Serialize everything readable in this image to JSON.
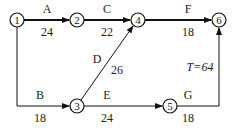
{
  "diagram": {
    "type": "activity-on-arrow network",
    "total_time_label": "T=64",
    "nodes": [
      {
        "id": "1",
        "label": "1",
        "x": 17,
        "y": 20
      },
      {
        "id": "2",
        "label": "2",
        "x": 77,
        "y": 20
      },
      {
        "id": "4",
        "label": "4",
        "x": 138,
        "y": 20
      },
      {
        "id": "6",
        "label": "6",
        "x": 219,
        "y": 20
      },
      {
        "id": "3",
        "label": "3",
        "x": 77,
        "y": 106
      },
      {
        "id": "5",
        "label": "5",
        "x": 170,
        "y": 106
      }
    ],
    "edges": [
      {
        "name": "A",
        "duration": "24",
        "from": "1",
        "to": "2",
        "critical": true
      },
      {
        "name": "C",
        "duration": "22",
        "from": "2",
        "to": "4",
        "critical": true
      },
      {
        "name": "F",
        "duration": "18",
        "from": "4",
        "to": "6",
        "critical": true
      },
      {
        "name": "B",
        "duration": "18",
        "from": "1",
        "to": "3",
        "critical": false
      },
      {
        "name": "D",
        "duration": "26",
        "from": "3",
        "to": "4",
        "critical": false
      },
      {
        "name": "E",
        "duration": "24",
        "from": "3",
        "to": "5",
        "critical": false
      },
      {
        "name": "G",
        "duration": "18",
        "from": "5",
        "to": "6",
        "critical": false
      }
    ]
  }
}
